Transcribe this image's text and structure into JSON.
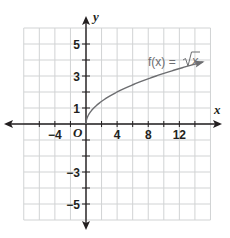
{
  "chart_data": {
    "type": "line",
    "title": "",
    "xlabel": "x",
    "ylabel": "y",
    "origin_label": "O",
    "xlim": [
      -8,
      16
    ],
    "ylim": [
      -6,
      6
    ],
    "grid": true,
    "x_grid_step": 2,
    "y_grid_step": 1,
    "x_tick_labels": [
      {
        "value": -4,
        "label": "−4"
      },
      {
        "value": 4,
        "label": "4"
      },
      {
        "value": 8,
        "label": "8"
      },
      {
        "value": 12,
        "label": "12"
      }
    ],
    "y_tick_labels": [
      {
        "value": 5,
        "label": "5"
      },
      {
        "value": 3,
        "label": "3"
      },
      {
        "value": 1,
        "label": "1"
      },
      {
        "value": -3,
        "label": "−3"
      },
      {
        "value": -5,
        "label": "−5"
      }
    ],
    "series": [
      {
        "name": "f(x) = √x",
        "function": "sqrt(x)",
        "domain": [
          0,
          15
        ],
        "arrow_end": true,
        "x": [
          0,
          0.25,
          1,
          2,
          4,
          6,
          8,
          10,
          12,
          15
        ],
        "y": [
          0,
          0.5,
          1,
          1.41,
          2,
          2.45,
          2.83,
          3.16,
          3.46,
          3.87
        ]
      }
    ],
    "annotations": [
      {
        "text": "f(x) = √x",
        "position": "upper right near curve"
      }
    ]
  },
  "labels": {
    "func_prefix": "f(x) = ",
    "func_radicand": "x"
  },
  "colors": {
    "grid": "#d1d3d4",
    "axis": "#231f20",
    "curve": "#6d6e71",
    "text": "#231f20"
  }
}
